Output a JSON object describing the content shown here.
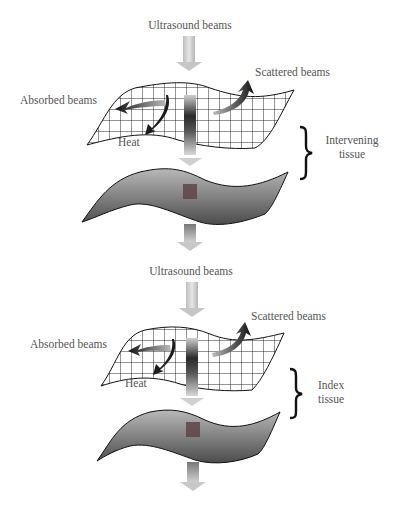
{
  "panels": [
    {
      "id": "top",
      "incoming_label": "Ultrasound beams",
      "scattered_label": "Scattered beams",
      "absorbed_label": "Absorbed beams",
      "heat_label": "Heat",
      "bracket_label_line1": "Intervening",
      "bracket_label_line2": "tissue"
    },
    {
      "id": "bottom",
      "incoming_label": "Ultrasound beams",
      "scattered_label": "Scattered beams",
      "absorbed_label": "Absorbed beams",
      "heat_label": "Heat",
      "bracket_label_line1": "Index",
      "bracket_label_line2": "tissue"
    }
  ],
  "colors": {
    "arrow_light": "#c8c8c8",
    "arrow_dark": "#1a1a1a",
    "tissue_fill_light": "#b0b0b0",
    "tissue_fill_dark": "#4a4a4a",
    "grid_line": "#111111",
    "focal_spot": "#5a3a3a"
  }
}
